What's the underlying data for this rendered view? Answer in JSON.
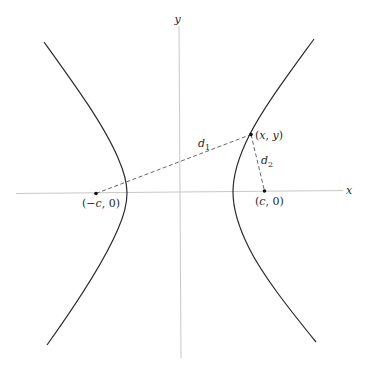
{
  "diagram": {
    "type": "hyperbola-foci-distances",
    "axes": {
      "x_label": "x",
      "y_label": "y"
    },
    "foci": [
      {
        "id": "left-focus",
        "label_open": "(",
        "label_var": "−c",
        "label_close": ", 0)"
      },
      {
        "id": "right-focus",
        "label_open": "(",
        "label_var": "c",
        "label_close": ", 0)"
      }
    ],
    "point": {
      "label": "(x, y)",
      "label_x": "x",
      "label_y": "y"
    },
    "distances": [
      {
        "id": "d1",
        "base": "d",
        "sub": "1"
      },
      {
        "id": "d2",
        "base": "d",
        "sub": "2"
      }
    ],
    "colors": {
      "curve": "#2b2b2b",
      "axis": "#c8c8c8",
      "dashed": "#555555",
      "text": "#2a2a2a"
    }
  }
}
